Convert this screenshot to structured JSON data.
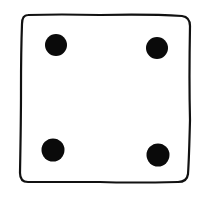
{
  "die": {
    "face_value": 4,
    "outline_color": "#111111",
    "pip_color": "#0a0a0a",
    "background": "#ffffff",
    "pips": [
      {
        "cx": 56,
        "cy": 45,
        "r": 11
      },
      {
        "cx": 157,
        "cy": 48,
        "r": 11
      },
      {
        "cx": 53,
        "cy": 150,
        "r": 11.5
      },
      {
        "cx": 158,
        "cy": 155,
        "r": 11.5
      }
    ]
  }
}
